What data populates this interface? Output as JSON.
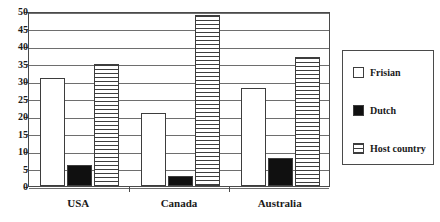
{
  "chart_data": {
    "type": "bar",
    "title": "",
    "subtitle": "",
    "xlabel": "",
    "ylabel": "",
    "categories": [
      "USA",
      "Canada",
      "Australia"
    ],
    "series": [
      {
        "name": "Frisian",
        "values": [
          31,
          21,
          28
        ],
        "fill": "white",
        "color": "#ffffff"
      },
      {
        "name": "Dutch",
        "values": [
          6,
          3,
          8
        ],
        "fill": "solid-black",
        "color": "#101010"
      },
      {
        "name": "Host country",
        "values": [
          35,
          49,
          37
        ],
        "fill": "horizontal-lines",
        "color": "#ffffff"
      }
    ],
    "ylim": [
      0,
      50
    ],
    "ytick_step": 5,
    "yticks": [
      0,
      5,
      10,
      15,
      20,
      25,
      30,
      35,
      40,
      45,
      50
    ],
    "ytick_labels": [
      "0",
      "5",
      "10",
      "15",
      "20",
      "25",
      "30",
      "35",
      "40",
      "45",
      "50"
    ],
    "grid": true,
    "grid_axis": "y",
    "legend_position": "right",
    "legend_entries": [
      "Frisian",
      "Dutch",
      "Host country"
    ]
  },
  "legend": {
    "items": [
      {
        "label": "Frisian"
      },
      {
        "label": "Dutch"
      },
      {
        "label": "Host country"
      }
    ]
  }
}
